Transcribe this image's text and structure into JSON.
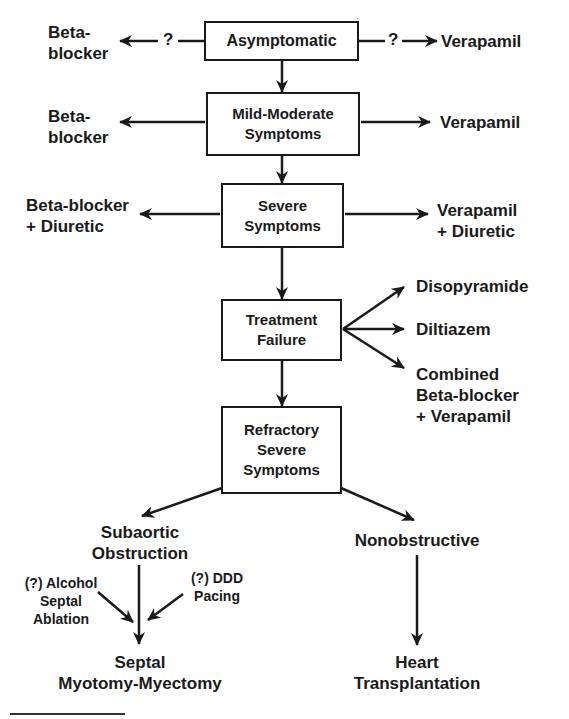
{
  "diagram": {
    "type": "flowchart",
    "nodes": {
      "asymptomatic": "Asymptomatic",
      "mild_moderate": "Mild-Moderate\nSymptoms",
      "severe": "Severe\nSymptoms",
      "treatment_failure": "Treatment\nFailure",
      "refractory": "Refractory\nSevere\nSymptoms",
      "subaortic": "Subaortic\nObstruction",
      "nonobstructive": "Nonobstructive",
      "septal_myectomy": "Septal\nMyotomy-Myectomy",
      "heart_transplant": "Heart\nTransplantation"
    },
    "labels": {
      "asym_left": "Beta-\nblocker",
      "asym_right": "Verapamil",
      "asym_left_q": "?",
      "asym_right_q": "?",
      "mild_left": "Beta-\nblocker",
      "mild_right": "Verapamil",
      "severe_left": "Beta-blocker\n+ Diuretic",
      "severe_right": "Verapamil\n+ Diuretic",
      "tf_opt1": "Disopyramide",
      "tf_opt2": "Diltiazem",
      "tf_opt3": "Combined\nBeta-blocker\n+ Verapamil",
      "alcohol_ablation": "(?) Alcohol\nSeptal\nAblation",
      "ddd_pacing": "(?) DDD\nPacing"
    },
    "edges": [
      [
        "Asymptomatic",
        "Mild-Moderate Symptoms"
      ],
      [
        "Mild-Moderate Symptoms",
        "Severe Symptoms"
      ],
      [
        "Severe Symptoms",
        "Treatment Failure"
      ],
      [
        "Treatment Failure",
        "Refractory Severe Symptoms"
      ],
      [
        "Refractory Severe Symptoms",
        "Subaortic Obstruction"
      ],
      [
        "Refractory Severe Symptoms",
        "Nonobstructive"
      ],
      [
        "Subaortic Obstruction",
        "Septal Myotomy-Myectomy"
      ],
      [
        "Nonobstructive",
        "Heart Transplantation"
      ]
    ],
    "colors": {
      "ink": "#1a1a1a",
      "background": "#ffffff"
    }
  }
}
